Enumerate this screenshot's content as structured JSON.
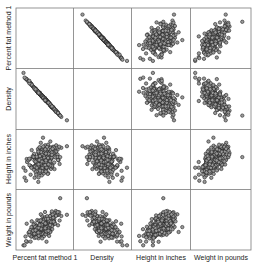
{
  "chart_data": {
    "type": "scatter",
    "subtype": "scatterplot_matrix",
    "title": "",
    "variables": [
      "Percent fat method 1",
      "Density",
      "Height in inches",
      "Weight in pounds"
    ],
    "grid": true,
    "diagonal": "empty",
    "point_style": {
      "shape": "open-circle",
      "fill": "#9a9a9a",
      "stroke": "#222222"
    },
    "relationships": [
      {
        "x": "Density",
        "y": "Percent fat method 1",
        "pattern": "strong negative linear"
      },
      {
        "x": "Height in inches",
        "y": "Percent fat method 1",
        "pattern": "no correlation, round cloud"
      },
      {
        "x": "Weight in pounds",
        "y": "Percent fat method 1",
        "pattern": "moderate positive, one outlier at high weight"
      },
      {
        "x": "Height in inches",
        "y": "Density",
        "pattern": "no correlation, round cloud"
      },
      {
        "x": "Weight in pounds",
        "y": "Density",
        "pattern": "moderate negative, one outlier at high weight"
      },
      {
        "x": "Weight in pounds",
        "y": "Height in inches",
        "pattern": "moderate positive, one outlier at high weight"
      }
    ],
    "n_points_approx": 250
  },
  "axes": {
    "row_labels": [
      "Percent fat method 1",
      "Density",
      "Height in inches",
      "Weight in pounds"
    ],
    "col_labels": [
      "Percent fat method 1",
      "Density",
      "Height in inches",
      "Weight in pounds"
    ]
  }
}
